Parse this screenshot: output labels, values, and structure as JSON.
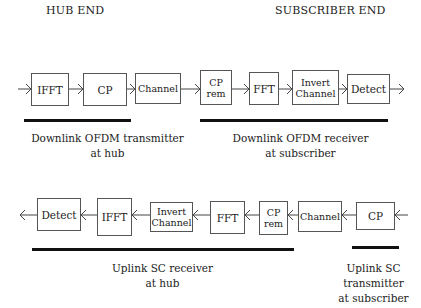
{
  "headers": {
    "hub": "HUB END",
    "subscriber": "SUBSCRIBER END"
  },
  "downlink": {
    "direction": "left-to-right",
    "blocks": [
      {
        "label": "IFFT"
      },
      {
        "label": "CP"
      },
      {
        "label": "Channel"
      },
      {
        "line1": "CP",
        "line2": "rem"
      },
      {
        "label": "FFT"
      },
      {
        "line1": "Invert",
        "line2": "Channel"
      },
      {
        "label": "Detect"
      }
    ],
    "groups": {
      "transmitter": {
        "line1": "Downlink OFDM transmitter",
        "line2": "at hub"
      },
      "receiver": {
        "line1": "Downlink OFDM receiver",
        "line2": "at subscriber"
      }
    }
  },
  "uplink": {
    "direction": "right-to-left",
    "blocks": [
      {
        "label": "Detect"
      },
      {
        "label": "IFFT"
      },
      {
        "line1": "Invert",
        "line2": "Channel"
      },
      {
        "label": "FFT"
      },
      {
        "line1": "CP",
        "line2": "rem"
      },
      {
        "label": "Channel"
      },
      {
        "label": "CP"
      }
    ],
    "groups": {
      "receiver": {
        "line1": "Uplink SC receiver",
        "line2": "at hub"
      },
      "transmitter": {
        "line1": "Uplink SC",
        "line2": "transmitter",
        "line3": "at subscriber"
      }
    }
  }
}
